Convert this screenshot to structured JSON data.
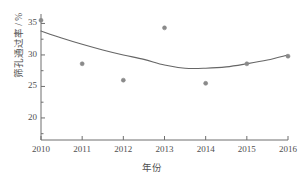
{
  "chart_data": {
    "type": "scatter",
    "title": "",
    "xlabel": "年份",
    "ylabel": "筛孔通过率 / %",
    "x": [
      2010,
      2011,
      2012,
      2013,
      2014,
      2015,
      2016
    ],
    "values": [
      35.5,
      28.6,
      26.0,
      34.3,
      25.5,
      28.6,
      29.8
    ],
    "series": [
      {
        "name": "筛孔通过率",
        "type": "scatter",
        "x": [
          2010,
          2011,
          2012,
          2013,
          2014,
          2015,
          2016
        ],
        "values": [
          35.5,
          28.6,
          26.0,
          34.3,
          25.5,
          28.6,
          29.8
        ]
      },
      {
        "name": "拟合曲线",
        "type": "line",
        "x": [
          2010,
          2010.5,
          2011,
          2011.5,
          2012,
          2012.5,
          2013,
          2013.5,
          2014,
          2014.5,
          2015,
          2015.5,
          2016
        ],
        "values": [
          33.8,
          32.7,
          31.7,
          30.8,
          30.0,
          29.3,
          28.4,
          27.9,
          27.9,
          28.1,
          28.6,
          29.2,
          30.0
        ]
      }
    ],
    "xlim": [
      2010,
      2016
    ],
    "ylim": [
      16.5,
      36.5
    ],
    "xticks": [
      2010,
      2011,
      2012,
      2013,
      2014,
      2015,
      2016
    ],
    "xtick_labels": [
      "2010",
      "2011",
      "2012",
      "2013",
      "2014",
      "2015",
      "2016"
    ],
    "yticks": [
      20,
      25,
      30,
      35
    ],
    "ytick_labels": [
      "20",
      "25",
      "30",
      "35"
    ],
    "yminor_ticks": [
      17.5,
      22.5,
      27.5,
      32.5
    ],
    "grid": false,
    "legend": "none",
    "colors": {
      "axis": "#6e6e6e",
      "marker": "#8a8a8a",
      "curve": "#666666",
      "text": "#4f4f4f",
      "background": "#ffffff"
    }
  }
}
